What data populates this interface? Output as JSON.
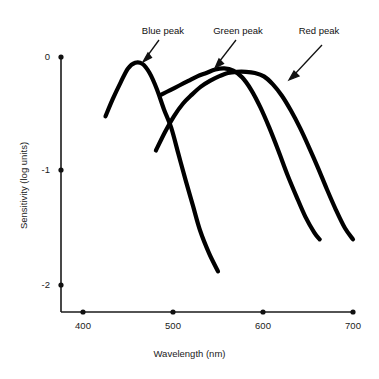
{
  "chart_data": {
    "type": "line",
    "title": "",
    "xlabel": "Wavelength (nm)",
    "ylabel": "Sensitivity (log units)",
    "xlim": [
      375,
      700
    ],
    "ylim": [
      -2.3,
      0.05
    ],
    "xticks": [
      400,
      500,
      600,
      700
    ],
    "xticklabels": [
      "400",
      "500",
      "600",
      "700"
    ],
    "yticks": [
      0,
      -1,
      -2
    ],
    "yticklabels": [
      "0",
      "-1",
      "-2"
    ],
    "grid": false,
    "legend_position": "none",
    "annotations": [
      {
        "text": "Blue peak",
        "label_x": 448,
        "label_y": 0.28,
        "arrow_to_x": 455,
        "arrow_to_y": -0.03
      },
      {
        "text": "Green peak",
        "label_x": 530,
        "label_y": 0.28,
        "arrow_to_x": 543,
        "arrow_to_y": -0.08
      },
      {
        "text": "Red peak",
        "label_x": 620,
        "label_y": 0.28,
        "arrow_to_x": 577,
        "arrow_to_y": -0.19
      }
    ],
    "series": [
      {
        "name": "Blue peak",
        "color": "#000000",
        "x": [
          425,
          433,
          442,
          450,
          458,
          466,
          474,
          482,
          490,
          498,
          506,
          514,
          522,
          530,
          540,
          550
        ],
        "y": [
          -0.52,
          -0.37,
          -0.22,
          -0.1,
          -0.05,
          -0.06,
          -0.14,
          -0.28,
          -0.46,
          -0.62,
          -0.85,
          -1.08,
          -1.3,
          -1.52,
          -1.72,
          -1.88
        ]
      },
      {
        "name": "Green peak",
        "color": "#000000",
        "x": [
          487,
          497,
          507,
          517,
          527,
          537,
          547,
          557,
          567,
          577,
          587,
          597,
          607,
          617,
          627,
          637,
          647,
          657,
          663
        ],
        "y": [
          -0.33,
          -0.29,
          -0.25,
          -0.21,
          -0.17,
          -0.14,
          -0.11,
          -0.1,
          -0.12,
          -0.18,
          -0.29,
          -0.44,
          -0.62,
          -0.82,
          -1.03,
          -1.22,
          -1.4,
          -1.54,
          -1.6
        ]
      },
      {
        "name": "Red peak",
        "color": "#000000",
        "x": [
          481,
          491,
          501,
          511,
          521,
          531,
          541,
          551,
          561,
          571,
          581,
          591,
          601,
          611,
          621,
          631,
          641,
          651,
          661,
          671,
          681,
          691,
          700
        ],
        "y": [
          -0.82,
          -0.66,
          -0.52,
          -0.41,
          -0.33,
          -0.26,
          -0.21,
          -0.17,
          -0.14,
          -0.13,
          -0.13,
          -0.14,
          -0.17,
          -0.24,
          -0.34,
          -0.47,
          -0.62,
          -0.79,
          -0.97,
          -1.16,
          -1.34,
          -1.5,
          -1.6
        ]
      }
    ]
  }
}
